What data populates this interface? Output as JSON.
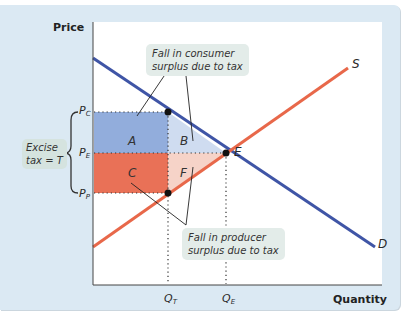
{
  "axes": {
    "y_title": "Price",
    "x_title": "Quantity"
  },
  "price_labels": {
    "pc": {
      "main": "P",
      "sub": "C"
    },
    "pe": {
      "main": "P",
      "sub": "E"
    },
    "pp": {
      "main": "P",
      "sub": "P"
    }
  },
  "quantity_labels": {
    "qt": {
      "main": "Q",
      "sub": "T"
    },
    "qe": {
      "main": "Q",
      "sub": "E"
    }
  },
  "curves": {
    "supply_label": "S",
    "demand_label": "D",
    "equilibrium_label": "E"
  },
  "regions": {
    "a": "A",
    "b": "B",
    "c": "C",
    "f": "F"
  },
  "callouts": {
    "consumer_line1": "Fall in consumer",
    "consumer_line2": "surplus due to tax",
    "producer_line1": "Fall in producer",
    "producer_line2": "surplus due to tax",
    "tax_line1": "Excise",
    "tax_line2": "tax = T"
  },
  "colors": {
    "panel_bg": "#dbe9f3",
    "demand": "#3f55a6",
    "supply": "#e8684a",
    "consumer_loss_A": "#7f9fd6",
    "consumer_loss_B": "#cfdcf0",
    "producer_loss_C": "#e8694e",
    "producer_loss_F": "#f6d3c8"
  }
}
